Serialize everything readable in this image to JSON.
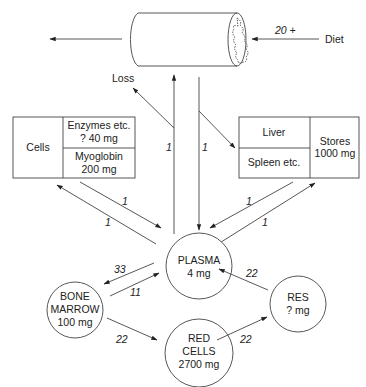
{
  "diagram": {
    "gut": {
      "name": "Intestine",
      "diet_label": "Diet",
      "diet_amount": "20 +",
      "loss_label": "Loss"
    },
    "cells_box": {
      "label": "Cells",
      "top_line1": "Enzymes etc.",
      "top_line2": "? 40 mg",
      "bottom_line1": "Myoglobin",
      "bottom_line2": "200 mg"
    },
    "stores_box": {
      "top": "Liver",
      "bottom": "Spleen etc.",
      "right_line1": "Stores",
      "right_line2": "1000 mg"
    },
    "nodes": {
      "plasma": {
        "line1": "PLASMA",
        "line2": "4 mg"
      },
      "bone_marrow": {
        "line1": "BONE",
        "line2": "MARROW",
        "line3": "100 mg"
      },
      "red_cells": {
        "line1": "RED",
        "line2": "CELLS",
        "line3": "2700 mg"
      },
      "res": {
        "line1": "RES",
        "line2": "? mg"
      }
    },
    "flows": {
      "plasma_to_gut": "1",
      "gut_to_plasma": "1",
      "cells_to_plasma": "1",
      "plasma_to_cells": "1",
      "stores_to_plasma": "1",
      "plasma_to_stores": "1",
      "plasma_to_marrow": "33",
      "marrow_to_plasma": "11",
      "marrow_to_redcells": "22",
      "redcells_to_res": "22",
      "res_to_plasma": "22"
    }
  }
}
